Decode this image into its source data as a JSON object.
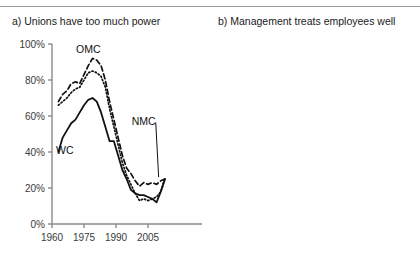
{
  "figure": {
    "panels": [
      {
        "id": "a",
        "title": "a) Unions have too much power",
        "y_ticks": [
          "0%",
          "20%",
          "40%",
          "60%",
          "80%",
          "100%"
        ],
        "x_ticks": [
          "1960",
          "1975",
          "1990",
          "2005"
        ],
        "series_labels": {
          "omc": "OMC",
          "nmc": "NMC",
          "wc": "WC"
        }
      },
      {
        "id": "b",
        "title": "b) Management treats employees well",
        "y_ticks": [
          "0%",
          "20%",
          "40%"
        ],
        "x_ticks": [
          "1960",
          "1975",
          "1990",
          "2005"
        ],
        "series_labels": {
          "omc": "OMC",
          "nmc": "NMC",
          "wc": "WC"
        }
      }
    ]
  },
  "chart_data": [
    {
      "type": "line",
      "panel": "a",
      "title": "a) Unions have too much power",
      "xlabel": "",
      "ylabel": "",
      "xlim": [
        1960,
        2014
      ],
      "ylim": [
        0,
        100
      ],
      "xticks": [
        1960,
        1975,
        1990,
        2005
      ],
      "yticks": [
        0,
        20,
        40,
        60,
        80,
        100
      ],
      "grid": false,
      "legend": "inline-annotations",
      "series": [
        {
          "name": "OMC",
          "style": "dashed",
          "x": [
            1963,
            1965,
            1967,
            1969,
            1971,
            1973,
            1975,
            1977,
            1979,
            1981,
            1983,
            1985,
            1987,
            1989,
            1991,
            1993,
            1995,
            1997,
            1999,
            2001,
            2003,
            2005,
            2007,
            2009,
            2011,
            2013
          ],
          "values": [
            68,
            72,
            74,
            78,
            79,
            78,
            83,
            88,
            92,
            91,
            88,
            80,
            68,
            58,
            48,
            38,
            31,
            28,
            24,
            21,
            23,
            22,
            23,
            22,
            24,
            25
          ]
        },
        {
          "name": "NMC",
          "style": "dotted",
          "x": [
            1963,
            1965,
            1967,
            1969,
            1971,
            1973,
            1975,
            1977,
            1979,
            1981,
            1983,
            1985,
            1987,
            1989,
            1991,
            1993,
            1995,
            1997,
            1999,
            2001,
            2003,
            2005,
            2007,
            2009,
            2011,
            2013
          ],
          "values": [
            66,
            68,
            70,
            73,
            75,
            76,
            80,
            84,
            85,
            84,
            82,
            76,
            64,
            54,
            44,
            34,
            27,
            22,
            17,
            13,
            14,
            13,
            14,
            15,
            18,
            26
          ]
        },
        {
          "name": "WC",
          "style": "solid",
          "x": [
            1963,
            1965,
            1967,
            1969,
            1971,
            1973,
            1975,
            1977,
            1979,
            1981,
            1983,
            1985,
            1987,
            1989,
            1991,
            1993,
            1995,
            1997,
            1999,
            2001,
            2003,
            2005,
            2007,
            2009,
            2011,
            2013
          ],
          "values": [
            40,
            48,
            52,
            56,
            58,
            62,
            66,
            69,
            70,
            68,
            62,
            54,
            46,
            46,
            38,
            30,
            25,
            19,
            17,
            16,
            16,
            15,
            14,
            12,
            18,
            25
          ]
        }
      ],
      "annotations": [
        {
          "text": "OMC",
          "x": 1977,
          "y": 97
        },
        {
          "text": "WC",
          "x": 1966,
          "y": 41
        },
        {
          "text": "NMC",
          "x": 2003,
          "y": 57,
          "leader_to": {
            "x": 2010,
            "y": 26
          }
        }
      ]
    },
    {
      "type": "line",
      "panel": "b",
      "title": "b) Management treats employees well",
      "xlabel": "",
      "ylabel": "",
      "xlim": [
        1960,
        2014
      ],
      "ylim": [
        0,
        50
      ],
      "xticks": [
        1960,
        1975,
        1990,
        2005
      ],
      "yticks": [
        0,
        20,
        40
      ],
      "grid": false,
      "legend": "inline-annotations",
      "series": [
        {
          "name": "OMC",
          "style": "dashed",
          "x": [
            1986,
            1988,
            1989,
            1990,
            1991,
            1992,
            1993,
            1994,
            1995,
            1996,
            1997,
            1998,
            1999,
            2000,
            2001,
            2002,
            2003,
            2004,
            2005,
            2006,
            2007,
            2008,
            2009,
            2010,
            2011,
            2012,
            2013
          ],
          "values": [
            44,
            42,
            38,
            43,
            39,
            45,
            41,
            29,
            26,
            29,
            27,
            30,
            31,
            32,
            31,
            32,
            34,
            33,
            37,
            41,
            38,
            40,
            42,
            39,
            36,
            37,
            35
          ]
        },
        {
          "name": "NMC",
          "style": "dotted",
          "x": [
            1986,
            1988,
            1989,
            1990,
            1991,
            1992,
            1993,
            1994,
            1995,
            1996,
            1997,
            1998,
            1999,
            2000,
            2001,
            2002,
            2003,
            2004,
            2005,
            2006,
            2007,
            2008,
            2009,
            2010,
            2011,
            2012,
            2013
          ],
          "values": [
            40,
            35,
            33,
            34,
            30,
            32,
            28,
            24,
            26,
            22,
            19,
            18,
            21,
            23,
            24,
            25,
            27,
            26,
            30,
            29,
            27,
            28,
            29,
            27,
            26,
            27,
            29
          ]
        },
        {
          "name": "WC",
          "style": "solid",
          "x": [
            1988,
            1990,
            1991,
            1992,
            1993,
            1994,
            1995,
            1996,
            1997,
            1998,
            1999,
            2000,
            2001,
            2002,
            2003,
            2004,
            2005,
            2006,
            2007,
            2008,
            2009,
            2010,
            2011,
            2012,
            2013
          ],
          "values": [
            15,
            12,
            11,
            9,
            11,
            8,
            9,
            7,
            6,
            7,
            7,
            9,
            8,
            9,
            8,
            9,
            9,
            8,
            9,
            9,
            9,
            8,
            8,
            8,
            7
          ]
        }
      ],
      "annotations": [
        {
          "text": "OMC",
          "x": 1988,
          "y": 45,
          "leader_to": {
            "x": 1991,
            "y": 41
          }
        },
        {
          "text": "NMC",
          "x": 1988,
          "y": 38,
          "leader_to": {
            "x": 1991,
            "y": 33
          }
        },
        {
          "text": "WC",
          "x": 1988,
          "y": 18
        }
      ]
    }
  ]
}
